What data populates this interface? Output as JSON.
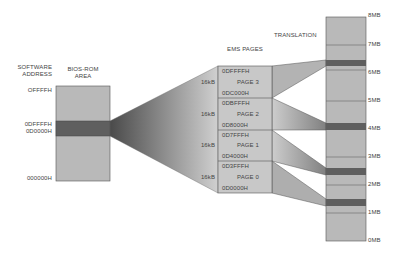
{
  "labels": {
    "software_address": "SOFTWARE\nADDRESS",
    "software_address_l1": "SOFTWARE",
    "software_address_l2": "ADDRESS",
    "bios_rom_l1": "BIOS-ROM",
    "bios_rom_l2": "AREA",
    "ems_pages": "EMS PAGES",
    "translation": "TRANSLATION"
  },
  "software_addresses": [
    "OFFFFH",
    "0DFFFFH",
    "0D0000H",
    "000000H"
  ],
  "ems_pages": [
    {
      "name": "PAGE 3",
      "size": "16kB",
      "top": "0DFFFFH",
      "bottom": "0DC000H",
      "maps_to_mb": 6.2
    },
    {
      "name": "PAGE 2",
      "size": "16kB",
      "top": "0DBFFFH",
      "bottom": "0D8000H",
      "maps_to_mb": 3.9
    },
    {
      "name": "PAGE 1",
      "size": "16kB",
      "top": "0D7FFFH",
      "bottom": "0D4000H",
      "maps_to_mb": 2.3
    },
    {
      "name": "PAGE 0",
      "size": "16kB",
      "top": "0D3FFFH",
      "bottom": "0D0000H",
      "maps_to_mb": 1.3
    }
  ],
  "memory_scale": [
    "8MB",
    "7MB",
    "6MB",
    "5MB",
    "4MB",
    "3MB",
    "2MB",
    "1MB",
    "0MB"
  ],
  "colors": {
    "light_gray": "#b9b9b9",
    "dark_band": "#6a6a6a",
    "outline": "#555555"
  }
}
